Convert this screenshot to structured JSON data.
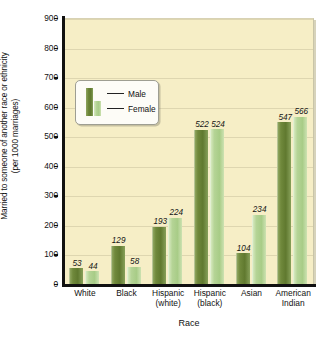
{
  "chart_data": {
    "type": "bar",
    "title": "",
    "xlabel": "Race",
    "ylabel": "Married to someone of another race or ethnicity",
    "ylabel_line2": "(per 1000 marriages)",
    "ylim": [
      0,
      900
    ],
    "yticks": [
      900,
      800,
      700,
      600,
      500,
      400,
      300,
      200,
      100,
      0
    ],
    "grid": true,
    "legend_position": "upper-left-inside",
    "categories": [
      {
        "line1": "White",
        "line2": ""
      },
      {
        "line1": "Black",
        "line2": ""
      },
      {
        "line1": "Hispanic",
        "line2": "(white)"
      },
      {
        "line1": "Hispanic",
        "line2": "(black)"
      },
      {
        "line1": "Asian",
        "line2": ""
      },
      {
        "line1": "American",
        "line2": "Indian"
      }
    ],
    "series": [
      {
        "name": "Male",
        "color": "#6d8639",
        "values": [
          53,
          129,
          193,
          522,
          104,
          547
        ]
      },
      {
        "name": "Female",
        "color": "#b5d496",
        "values": [
          44,
          58,
          224,
          524,
          234,
          566
        ]
      }
    ]
  },
  "legend": {
    "entries": [
      {
        "label": "Male"
      },
      {
        "label": "Female"
      }
    ]
  },
  "colors": {
    "plot_background": "#f6eec6",
    "gridline": "#ded6b0",
    "axis": "#111111",
    "male_bar": "#6d8639",
    "female_bar": "#b5d496",
    "page_background": "#ffffff"
  }
}
